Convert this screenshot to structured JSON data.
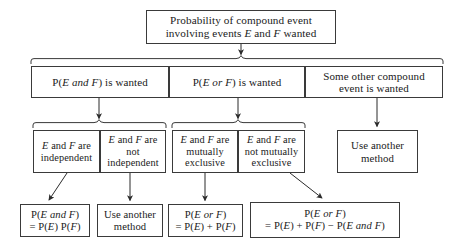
{
  "figure": {
    "type": "flowchart",
    "background": "#ffffff",
    "stroke": "#3a3a3a"
  },
  "nodes": {
    "root": "Probability of compound event\ninvolving events E and F wanted",
    "and_wanted": "P(E and F) is wanted",
    "or_wanted": "P(E or F) is wanted",
    "other_compound": "Some other compound\nevent is wanted",
    "independent": "E and F are\nindependent",
    "not_independent": "E and F are\nnot\nindependent",
    "mutually_exclusive": "E and F are\nmutually\nexclusive",
    "not_mutually_exclusive": "E and F are\nnot mutually\nexclusive",
    "use_another_method_top": "Use another\nmethod",
    "formula_and": "P(E and F)\n= P(E) P(F)",
    "use_another_method_bottom": "Use another\nmethod",
    "formula_or_exclusive": "P(E or F)\n= P(E) + P(F)",
    "formula_or_general": "P(E or F)\n= P(E) + P(F) − P(E and F)"
  },
  "edges": [
    {
      "from": "root",
      "to": "row2-brace",
      "style": "arrow-down"
    },
    {
      "from": "and_wanted",
      "to": "row3-brace-left",
      "style": "arrow-down"
    },
    {
      "from": "or_wanted",
      "to": "row3-brace-right",
      "style": "arrow-down"
    },
    {
      "from": "other_compound",
      "to": "use_another_method_top",
      "style": "arrow-down"
    },
    {
      "from": "independent",
      "to": "formula_and",
      "style": "arrow-diagonal-left"
    },
    {
      "from": "not_independent",
      "to": "use_another_method_bottom",
      "style": "arrow-down"
    },
    {
      "from": "mutually_exclusive",
      "to": "formula_or_exclusive",
      "style": "arrow-down"
    },
    {
      "from": "not_mutually_exclusive",
      "to": "formula_or_general",
      "style": "arrow-diagonal-right"
    }
  ]
}
